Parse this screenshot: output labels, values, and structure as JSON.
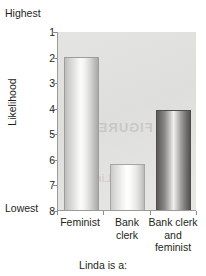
{
  "chart_data": {
    "type": "bar",
    "title": "",
    "xlabel": "Linda is a:",
    "ylabel": "Likelihood",
    "categories": [
      "Feminist",
      "Bank clerk",
      "Bank clerk and feminist"
    ],
    "category_lines": [
      [
        "Feminist"
      ],
      [
        "Bank",
        "clerk"
      ],
      [
        "Bank clerk",
        "and",
        "feminist"
      ]
    ],
    "values": [
      2.0,
      6.2,
      4.1
    ],
    "ylim": [
      1,
      8
    ],
    "y_axis_inverted": true,
    "yticks": [
      1,
      2,
      3,
      4,
      5,
      6,
      7,
      8
    ],
    "ytick_labels": [
      "1",
      "2",
      "3",
      "4",
      "5",
      "6",
      "7",
      "8"
    ],
    "axis_extreme_high_label": "Highest",
    "axis_extreme_low_label": "Lowest",
    "grid": false,
    "legend": null,
    "bar_styles": [
      "light",
      "lightest",
      "dark"
    ],
    "series": [
      {
        "name": "Rated likelihood",
        "values": [
          2.0,
          6.2,
          4.1
        ]
      }
    ],
    "watermark_text": "FIGURE 9.2",
    "watermark_text_2": "Linda",
    "colors": {
      "plot_background": "#e1e1e0",
      "axis_line": "#9a9a9a",
      "text": "#231f20",
      "bar_light": "#dcdcda",
      "bar_lightest": "#f0f0ee",
      "bar_dark": "#7a7876"
    }
  }
}
